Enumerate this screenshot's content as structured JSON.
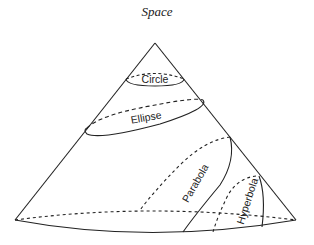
{
  "title": "Space",
  "labels": {
    "circle": "Circle",
    "ellipse": "Ellipse",
    "parabola": "Parabola",
    "hyperbola": "Hyperbola"
  },
  "colors": {
    "line": "#222222",
    "background": "#ffffff"
  }
}
